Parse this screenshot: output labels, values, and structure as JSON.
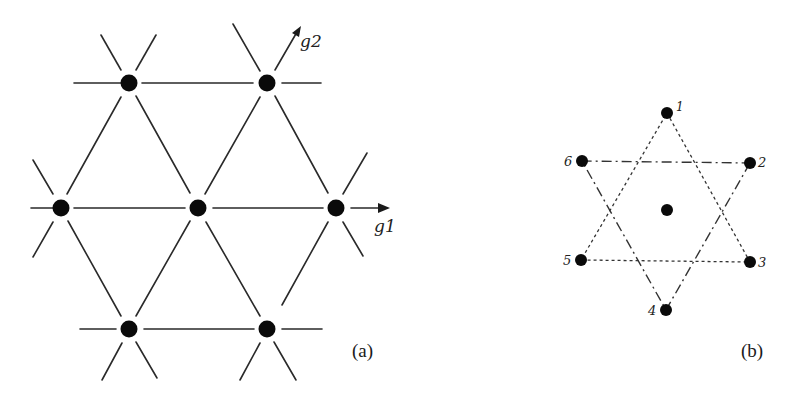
{
  "figure": {
    "panel_a": {
      "label": "(a)",
      "vectors": {
        "g1": "g1",
        "g2": "g2"
      },
      "lattice_points": [
        {
          "x": 129,
          "y": 83
        },
        {
          "x": 267,
          "y": 83
        },
        {
          "x": 61,
          "y": 208
        },
        {
          "x": 198,
          "y": 208
        },
        {
          "x": 336,
          "y": 208
        },
        {
          "x": 129,
          "y": 329
        },
        {
          "x": 267,
          "y": 329
        }
      ]
    },
    "panel_b": {
      "label": "(b)",
      "points": [
        {
          "id": "1",
          "label": "1"
        },
        {
          "id": "2",
          "label": "2"
        },
        {
          "id": "3",
          "label": "3"
        },
        {
          "id": "4",
          "label": "4"
        },
        {
          "id": "5",
          "label": "5"
        },
        {
          "id": "6",
          "label": "6"
        }
      ],
      "center_point": true,
      "triangles": [
        {
          "vertices": [
            "1",
            "3",
            "5"
          ],
          "style": "dotted"
        },
        {
          "vertices": [
            "2",
            "4",
            "6"
          ],
          "style": "dash-dot"
        }
      ]
    }
  }
}
